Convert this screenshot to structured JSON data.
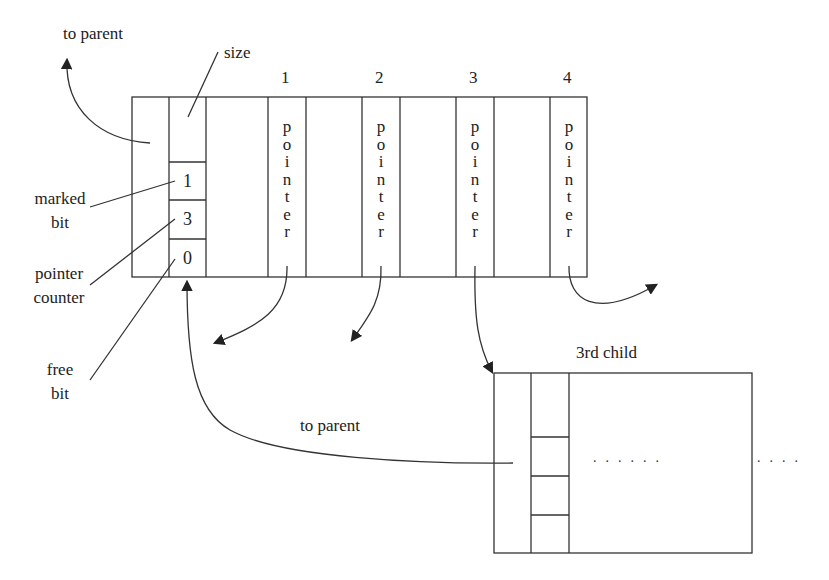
{
  "diagram": {
    "labels": {
      "to_parent_top": "to parent",
      "size": "size",
      "marked_bit": [
        "marked",
        "bit"
      ],
      "pointer_counter": [
        "pointer",
        "counter"
      ],
      "free_bit": [
        "free",
        "bit"
      ],
      "to_parent_bottom": "to parent",
      "third_child": "3rd child"
    },
    "header_fields": {
      "marked_bit_value": "1",
      "pointer_counter_value": "3",
      "free_bit_value": "0"
    },
    "pointer_slots": [
      {
        "index": "1",
        "label": "pointer"
      },
      {
        "index": "2",
        "label": "pointer"
      },
      {
        "index": "3",
        "label": "pointer"
      },
      {
        "index": "4",
        "label": "pointer"
      }
    ],
    "ellipsis_inside": "......",
    "ellipsis_outside": "....",
    "stroke_color": "#333333",
    "background": "#ffffff"
  }
}
